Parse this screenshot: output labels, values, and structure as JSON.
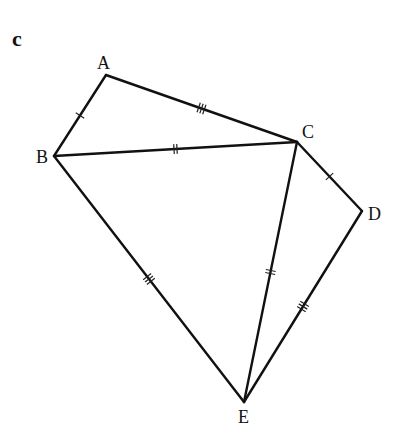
{
  "figure": {
    "part_label": "c",
    "background": "#ffffff",
    "stroke_color": "#111111"
  },
  "vertices": {
    "A": {
      "label": "A",
      "x": 106,
      "y": 75,
      "lx": 97,
      "ly": 69
    },
    "B": {
      "label": "B",
      "x": 54,
      "y": 156,
      "lx": 36,
      "ly": 163
    },
    "C": {
      "label": "C",
      "x": 297,
      "y": 142,
      "lx": 302,
      "ly": 138
    },
    "D": {
      "label": "D",
      "x": 362,
      "y": 211,
      "lx": 368,
      "ly": 220
    },
    "E": {
      "label": "E",
      "x": 244,
      "y": 402,
      "lx": 238,
      "ly": 423
    }
  },
  "edges": [
    {
      "name": "AB",
      "from": "A",
      "to": "B",
      "ticks": 1
    },
    {
      "name": "AC",
      "from": "A",
      "to": "C",
      "ticks": 3
    },
    {
      "name": "BC",
      "from": "B",
      "to": "C",
      "ticks": 2
    },
    {
      "name": "CD",
      "from": "C",
      "to": "D",
      "ticks": 1
    },
    {
      "name": "BE",
      "from": "B",
      "to": "E",
      "ticks": 3
    },
    {
      "name": "CE",
      "from": "C",
      "to": "E",
      "ticks": 2
    },
    {
      "name": "DE",
      "from": "D",
      "to": "E",
      "ticks": 3
    }
  ]
}
